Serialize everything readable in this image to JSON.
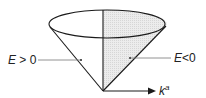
{
  "diagram": {
    "labels": {
      "left_region_var": "E",
      "left_region_rel": " > 0",
      "right_region_var": "E",
      "right_region_rel": "<0",
      "axis_var": "k",
      "axis_sup": "a"
    },
    "colors": {
      "stroke": "#1a1a1a",
      "shade": "#e6e6e6",
      "leader": "#777777"
    }
  }
}
